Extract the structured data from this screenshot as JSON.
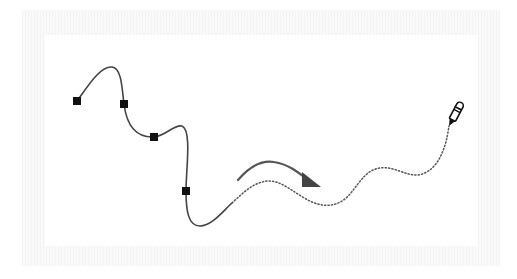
{
  "diagram": {
    "title": "",
    "colors": {
      "frame": "#f3f3f3",
      "canvas": "#ffffff",
      "solid_path": "#444444",
      "dotted_path": "#555555",
      "anchor": "#111111",
      "arrow": "#555555",
      "pen_icon": "#111111"
    },
    "solid_path": {
      "style": "solid",
      "anchors": [
        {
          "x": 77,
          "y": 101
        },
        {
          "x": 124,
          "y": 104
        },
        {
          "x": 154,
          "y": 137
        },
        {
          "x": 186,
          "y": 191
        }
      ]
    },
    "dotted_path": {
      "style": "dotted"
    },
    "arrow": {
      "direction": "right",
      "meaning": "drawing direction"
    },
    "icons": [
      "pen-icon",
      "arrow-icon"
    ]
  }
}
